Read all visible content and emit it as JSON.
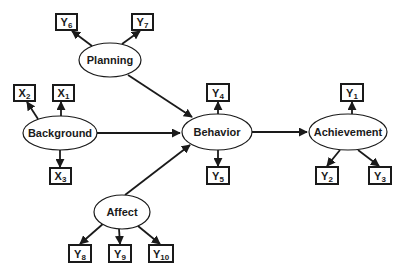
{
  "diagram": {
    "type": "structural-equation-model",
    "colors": {
      "stroke": "#1a1a1a",
      "fill": "#ffffff",
      "background": "#ffffff"
    },
    "latent": [
      {
        "id": "planning",
        "label": "Planning",
        "cx": 110,
        "cy": 60,
        "rx": 31,
        "ry": 17
      },
      {
        "id": "background",
        "label": "Background",
        "cx": 60,
        "cy": 133,
        "rx": 37,
        "ry": 17
      },
      {
        "id": "behavior",
        "label": "Behavior",
        "cx": 217,
        "cy": 132,
        "rx": 35,
        "ry": 18
      },
      {
        "id": "achievement",
        "label": "Achievement",
        "cx": 348,
        "cy": 132,
        "rx": 39,
        "ry": 18
      },
      {
        "id": "affect",
        "label": "Affect",
        "cx": 122,
        "cy": 212,
        "rx": 28,
        "ry": 17
      }
    ],
    "indicators": [
      {
        "id": "y6",
        "base": "Y",
        "sub": "6",
        "x": 56,
        "y": 14,
        "w": 21,
        "h": 16
      },
      {
        "id": "y7",
        "base": "Y",
        "sub": "7",
        "x": 132,
        "y": 14,
        "w": 21,
        "h": 16
      },
      {
        "id": "x2",
        "base": "X",
        "sub": "2",
        "x": 14,
        "y": 85,
        "w": 21,
        "h": 16
      },
      {
        "id": "x1",
        "base": "X",
        "sub": "1",
        "x": 53,
        "y": 85,
        "w": 21,
        "h": 16
      },
      {
        "id": "x3",
        "base": "X",
        "sub": "3",
        "x": 50,
        "y": 168,
        "w": 21,
        "h": 16
      },
      {
        "id": "y4",
        "base": "Y",
        "sub": "4",
        "x": 207,
        "y": 84,
        "w": 22,
        "h": 17
      },
      {
        "id": "y5",
        "base": "Y",
        "sub": "5",
        "x": 207,
        "y": 167,
        "w": 22,
        "h": 17
      },
      {
        "id": "y1",
        "base": "Y",
        "sub": "1",
        "x": 341,
        "y": 84,
        "w": 22,
        "h": 17
      },
      {
        "id": "y2",
        "base": "Y",
        "sub": "2",
        "x": 316,
        "y": 167,
        "w": 22,
        "h": 17
      },
      {
        "id": "y3",
        "base": "Y",
        "sub": "3",
        "x": 369,
        "y": 167,
        "w": 22,
        "h": 17
      },
      {
        "id": "y8",
        "base": "Y",
        "sub": "8",
        "x": 69,
        "y": 245,
        "w": 22,
        "h": 17
      },
      {
        "id": "y9",
        "base": "Y",
        "sub": "9",
        "x": 109,
        "y": 245,
        "w": 22,
        "h": 17
      },
      {
        "id": "y10",
        "base": "Y",
        "sub": "10",
        "x": 149,
        "y": 245,
        "w": 24,
        "h": 17
      }
    ],
    "edges": [
      {
        "from": "planning",
        "to": "y6",
        "x1": 92,
        "y1": 46,
        "x2": 72,
        "y2": 31
      },
      {
        "from": "planning",
        "to": "y7",
        "x1": 122,
        "y1": 44,
        "x2": 140,
        "y2": 31
      },
      {
        "from": "planning",
        "to": "behavior",
        "x1": 128,
        "y1": 75,
        "x2": 192,
        "y2": 117
      },
      {
        "from": "background",
        "to": "x2",
        "x1": 38,
        "y1": 119,
        "x2": 27,
        "y2": 102
      },
      {
        "from": "background",
        "to": "x1",
        "x1": 61,
        "y1": 116,
        "x2": 61,
        "y2": 102
      },
      {
        "from": "background",
        "to": "x3",
        "x1": 60,
        "y1": 150,
        "x2": 60,
        "y2": 167
      },
      {
        "from": "background",
        "to": "behavior",
        "x1": 97,
        "y1": 133,
        "x2": 180,
        "y2": 133
      },
      {
        "from": "affect",
        "to": "behavior",
        "x1": 125,
        "y1": 195,
        "x2": 190,
        "y2": 145
      },
      {
        "from": "affect",
        "to": "y8",
        "x1": 104,
        "y1": 223,
        "x2": 80,
        "y2": 244
      },
      {
        "from": "affect",
        "to": "y9",
        "x1": 119,
        "y1": 229,
        "x2": 120,
        "y2": 244
      },
      {
        "from": "affect",
        "to": "y10",
        "x1": 138,
        "y1": 226,
        "x2": 160,
        "y2": 244
      },
      {
        "from": "behavior",
        "to": "y4",
        "x1": 218,
        "y1": 114,
        "x2": 218,
        "y2": 102
      },
      {
        "from": "behavior",
        "to": "y5",
        "x1": 218,
        "y1": 150,
        "x2": 218,
        "y2": 166
      },
      {
        "from": "behavior",
        "to": "achievement",
        "x1": 252,
        "y1": 132,
        "x2": 307,
        "y2": 132
      },
      {
        "from": "achievement",
        "to": "y1",
        "x1": 352,
        "y1": 114,
        "x2": 352,
        "y2": 102
      },
      {
        "from": "achievement",
        "to": "y2",
        "x1": 340,
        "y1": 150,
        "x2": 327,
        "y2": 166
      },
      {
        "from": "achievement",
        "to": "y3",
        "x1": 358,
        "y1": 150,
        "x2": 379,
        "y2": 166
      }
    ]
  }
}
